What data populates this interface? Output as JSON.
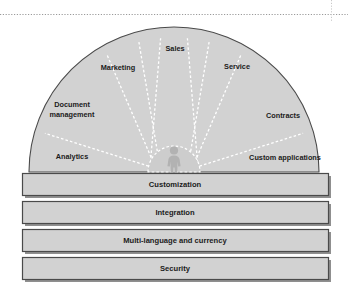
{
  "figure": {
    "background_color": "#ffffff"
  },
  "top_rule": {
    "style": "dotted",
    "color": "#9a9a9a"
  },
  "right_rule": {
    "style": "dotted",
    "color": "#c8c8c8"
  },
  "hub": {
    "icon": "person-icon",
    "fill": "#cdcdcd",
    "figure_color": "#b4b4b4"
  },
  "fan": {
    "fill": "#d2d2d2",
    "outline_color": "#4a4a4a",
    "divider_color": "#ffffff",
    "divider_style": "dashed",
    "segments": [
      {
        "label": "Analytics",
        "name": "fan-segment-analytics"
      },
      {
        "label": "Document management",
        "name": "fan-segment-document-management"
      },
      {
        "label": "Marketing",
        "name": "fan-segment-marketing"
      },
      {
        "label": "Sales",
        "name": "fan-segment-sales"
      },
      {
        "label": "Service",
        "name": "fan-segment-service"
      },
      {
        "label": "Contracts",
        "name": "fan-segment-contracts"
      },
      {
        "label": "Custom applications",
        "name": "fan-segment-custom-applications"
      }
    ]
  },
  "segment_text": {
    "analytics": "Analytics",
    "document_management_line1": "Document",
    "document_management_line2": "management",
    "marketing": "Marketing",
    "sales": "Sales",
    "service": "Service",
    "contracts": "Contracts",
    "custom_applications": "Custom applications"
  },
  "foundation": {
    "fill": "#d2d2d2",
    "border_color": "#4a4a4a",
    "shadow_color": "#8f8f8f",
    "bars": [
      {
        "label": "Customization",
        "name": "foundation-bar-customization"
      },
      {
        "label": "Integration",
        "name": "foundation-bar-integration"
      },
      {
        "label": "Multi-language and currency",
        "name": "foundation-bar-multi-language-and-currency"
      },
      {
        "label": "Security",
        "name": "foundation-bar-security"
      }
    ]
  },
  "bar_text": {
    "customization": "Customization",
    "integration": "Integration",
    "multilanguage": "Multi-language and currency",
    "security": "Security"
  }
}
